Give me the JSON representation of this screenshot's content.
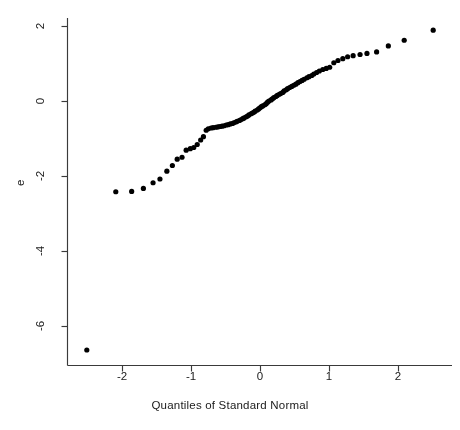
{
  "chart_data": {
    "type": "scatter",
    "title": "",
    "xlabel": "Quantiles of Standard Normal",
    "ylabel": "e",
    "xlim": [
      -2.72,
      2.75
    ],
    "ylim": [
      -6.95,
      2.33
    ],
    "grid": false,
    "legend": null,
    "xticks": [
      -2,
      -1,
      0,
      1,
      2
    ],
    "xticklabels": [
      "-2",
      "-1",
      "0",
      "1",
      "2"
    ],
    "yticks": [
      2,
      0,
      -2,
      -4,
      -6
    ],
    "yticklabels": [
      "2",
      "0",
      "-2",
      "-4",
      "-6"
    ],
    "marker": "filled-circle",
    "marker_color": "#000000",
    "marker_size": 3.4,
    "axis_color": "#3a3a3a",
    "background_color": "#ffffff",
    "points": [
      [
        -2.51,
        -6.64
      ],
      [
        -2.09,
        -2.42
      ],
      [
        -1.86,
        -2.41
      ],
      [
        -1.69,
        -2.33
      ],
      [
        -1.55,
        -2.18
      ],
      [
        -1.45,
        -2.08
      ],
      [
        -1.35,
        -1.87
      ],
      [
        -1.27,
        -1.72
      ],
      [
        -1.2,
        -1.55
      ],
      [
        -1.13,
        -1.5
      ],
      [
        -1.07,
        -1.31
      ],
      [
        -1.01,
        -1.27
      ],
      [
        -0.96,
        -1.24
      ],
      [
        -0.91,
        -1.16
      ],
      [
        -0.86,
        -1.04
      ],
      [
        -0.82,
        -0.95
      ],
      [
        -0.78,
        -0.78
      ],
      [
        -0.75,
        -0.74
      ],
      [
        -0.71,
        -0.72
      ],
      [
        -0.68,
        -0.71
      ],
      [
        -0.64,
        -0.7
      ],
      [
        -0.61,
        -0.69
      ],
      [
        -0.58,
        -0.68
      ],
      [
        -0.55,
        -0.67
      ],
      [
        -0.52,
        -0.66
      ],
      [
        -0.49,
        -0.64
      ],
      [
        -0.46,
        -0.63
      ],
      [
        -0.43,
        -0.61
      ],
      [
        -0.4,
        -0.6
      ],
      [
        -0.38,
        -0.58
      ],
      [
        -0.35,
        -0.56
      ],
      [
        -0.33,
        -0.54
      ],
      [
        -0.3,
        -0.52
      ],
      [
        -0.28,
        -0.5
      ],
      [
        -0.25,
        -0.47
      ],
      [
        -0.23,
        -0.45
      ],
      [
        -0.2,
        -0.42
      ],
      [
        -0.18,
        -0.4
      ],
      [
        -0.16,
        -0.37
      ],
      [
        -0.13,
        -0.34
      ],
      [
        -0.11,
        -0.32
      ],
      [
        -0.09,
        -0.3
      ],
      [
        -0.07,
        -0.27
      ],
      [
        -0.04,
        -0.24
      ],
      [
        -0.02,
        -0.21
      ],
      [
        0.0,
        -0.18
      ],
      [
        0.02,
        -0.15
      ],
      [
        0.04,
        -0.13
      ],
      [
        0.07,
        -0.1
      ],
      [
        0.09,
        -0.07
      ],
      [
        0.11,
        -0.03
      ],
      [
        0.13,
        0.0
      ],
      [
        0.16,
        0.03
      ],
      [
        0.18,
        0.06
      ],
      [
        0.2,
        0.09
      ],
      [
        0.23,
        0.12
      ],
      [
        0.25,
        0.15
      ],
      [
        0.28,
        0.18
      ],
      [
        0.3,
        0.2
      ],
      [
        0.33,
        0.23
      ],
      [
        0.35,
        0.27
      ],
      [
        0.38,
        0.3
      ],
      [
        0.4,
        0.33
      ],
      [
        0.43,
        0.36
      ],
      [
        0.46,
        0.39
      ],
      [
        0.49,
        0.42
      ],
      [
        0.52,
        0.45
      ],
      [
        0.55,
        0.49
      ],
      [
        0.58,
        0.52
      ],
      [
        0.61,
        0.55
      ],
      [
        0.64,
        0.58
      ],
      [
        0.68,
        0.62
      ],
      [
        0.71,
        0.65
      ],
      [
        0.75,
        0.68
      ],
      [
        0.78,
        0.72
      ],
      [
        0.82,
        0.76
      ],
      [
        0.86,
        0.8
      ],
      [
        0.91,
        0.84
      ],
      [
        0.96,
        0.87
      ],
      [
        1.01,
        0.9
      ],
      [
        1.07,
        1.02
      ],
      [
        1.13,
        1.08
      ],
      [
        1.2,
        1.13
      ],
      [
        1.27,
        1.18
      ],
      [
        1.35,
        1.21
      ],
      [
        1.45,
        1.24
      ],
      [
        1.55,
        1.27
      ],
      [
        1.69,
        1.31
      ],
      [
        1.86,
        1.47
      ],
      [
        2.09,
        1.62
      ],
      [
        2.51,
        1.89
      ]
    ]
  }
}
